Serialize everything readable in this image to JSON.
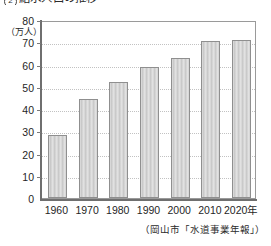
{
  "figure": {
    "number": "2",
    "title": "給水人口の推移",
    "source_note": "（岡山市「水道事業年報」）"
  },
  "chart_data": {
    "type": "bar",
    "title": "給水人口の推移",
    "categories": [
      "1960",
      "1970",
      "1980",
      "1990",
      "2000",
      "2010",
      "2020年"
    ],
    "values": [
      28.5,
      44.5,
      52.0,
      59.0,
      63.0,
      70.5,
      71.0
    ],
    "xlabel": "",
    "ylabel": "（万人）",
    "ylim": [
      0,
      80
    ],
    "ytick_labels": [
      "80",
      "70",
      "60",
      "50",
      "40",
      "30",
      "20",
      "10",
      "0"
    ],
    "ytick_values": [
      80,
      70,
      60,
      50,
      40,
      30,
      20,
      10,
      0
    ],
    "grid": true,
    "grid_style": "dotted",
    "legend": null,
    "bar_color": "#c9c9c9",
    "bar_border_color": "#8f8f8f",
    "axis_color": "#6f6f6f",
    "grid_color": "#c2c2c2",
    "source": "（岡山市「水道事業年報」）"
  }
}
